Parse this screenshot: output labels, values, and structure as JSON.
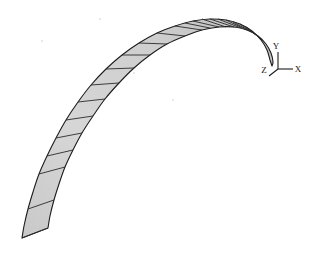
{
  "figure": {
    "background_color": "#ffffff",
    "surface_fill": "#d2d2d2",
    "surface_fill_light": "#dcdcdc",
    "surface_fill_dark": "#bdbdbd",
    "outline_color": "#1c1c1c",
    "rule_line_color": "#2b2b2b"
  },
  "axes": {
    "origin": {
      "x": 278,
      "y": 69
    },
    "labels": {
      "x": "X",
      "y": "Y",
      "z": "Z"
    },
    "label_positions": {
      "x": {
        "x": 298,
        "y": 72
      },
      "y": {
        "x": 276,
        "y": 49
      },
      "z": {
        "x": 264,
        "y": 73
      }
    },
    "axis_lines": {
      "x": {
        "x1": 278,
        "y1": 69,
        "x2": 293,
        "y2": 69
      },
      "y": {
        "x1": 278,
        "y1": 69,
        "x2": 278,
        "y2": 52
      },
      "z": {
        "x1": 278,
        "y1": 69,
        "x2": 269,
        "y2": 76
      }
    }
  },
  "surface": {
    "type": "developable-ruled-strip",
    "segment_count": 22,
    "description": "Tapering curved strip sweeping from lower-left pointed tip up over an apex and hooking down at the right",
    "outer_edge": [
      [
        22,
        238
      ],
      [
        24,
        226
      ],
      [
        28,
        209
      ],
      [
        33,
        192
      ],
      [
        39,
        174
      ],
      [
        47,
        156
      ],
      [
        56,
        138
      ],
      [
        66,
        120
      ],
      [
        78,
        102
      ],
      [
        91,
        85
      ],
      [
        106,
        69
      ],
      [
        122,
        55
      ],
      [
        139,
        43
      ],
      [
        157,
        33
      ],
      [
        175,
        26
      ],
      [
        193,
        21
      ],
      [
        210,
        19
      ],
      [
        226,
        20
      ],
      [
        240,
        24
      ],
      [
        252,
        31
      ],
      [
        261,
        40
      ],
      [
        267,
        50
      ],
      [
        270,
        60
      ]
    ],
    "inner_edge": [
      [
        48,
        228
      ],
      [
        50,
        216
      ],
      [
        54,
        200
      ],
      [
        59,
        184
      ],
      [
        65,
        167
      ],
      [
        73,
        150
      ],
      [
        82,
        133
      ],
      [
        93,
        116
      ],
      [
        105,
        99
      ],
      [
        119,
        83
      ],
      [
        134,
        68
      ],
      [
        150,
        55
      ],
      [
        167,
        44
      ],
      [
        185,
        36
      ],
      [
        202,
        30
      ],
      [
        219,
        27
      ],
      [
        234,
        27
      ],
      [
        247,
        30
      ],
      [
        258,
        36
      ],
      [
        266,
        44
      ],
      [
        271,
        53
      ],
      [
        273,
        62
      ],
      [
        272,
        66
      ]
    ],
    "rule_lines": [
      {
        "from": [
          22,
          238
        ],
        "to": [
          48,
          228
        ]
      },
      {
        "from": [
          28,
          209
        ],
        "to": [
          54,
          200
        ]
      },
      {
        "from": [
          39,
          174
        ],
        "to": [
          65,
          167
        ]
      },
      {
        "from": [
          47,
          156
        ],
        "to": [
          73,
          150
        ]
      },
      {
        "from": [
          56,
          138
        ],
        "to": [
          82,
          133
        ]
      },
      {
        "from": [
          66,
          120
        ],
        "to": [
          93,
          116
        ]
      },
      {
        "from": [
          78,
          102
        ],
        "to": [
          105,
          99
        ]
      },
      {
        "from": [
          91,
          85
        ],
        "to": [
          119,
          83
        ]
      },
      {
        "from": [
          106,
          69
        ],
        "to": [
          134,
          68
        ]
      },
      {
        "from": [
          122,
          55
        ],
        "to": [
          150,
          55
        ]
      },
      {
        "from": [
          139,
          43
        ],
        "to": [
          167,
          44
        ]
      },
      {
        "from": [
          157,
          33
        ],
        "to": [
          185,
          36
        ]
      },
      {
        "from": [
          175,
          26
        ],
        "to": [
          202,
          30
        ]
      },
      {
        "from": [
          185,
          23
        ],
        "to": [
          210,
          28
        ]
      },
      {
        "from": [
          193,
          21
        ],
        "to": [
          219,
          27
        ]
      },
      {
        "from": [
          202,
          19
        ],
        "to": [
          226,
          27
        ]
      },
      {
        "from": [
          210,
          19
        ],
        "to": [
          234,
          27
        ]
      },
      {
        "from": [
          218,
          19
        ],
        "to": [
          241,
          28
        ]
      },
      {
        "from": [
          226,
          20
        ],
        "to": [
          247,
          30
        ]
      },
      {
        "from": [
          233,
          22
        ],
        "to": [
          252,
          32
        ]
      },
      {
        "from": [
          240,
          24
        ],
        "to": [
          258,
          36
        ]
      },
      {
        "from": [
          246,
          27
        ],
        "to": [
          262,
          40
        ]
      }
    ]
  },
  "background_specks": [
    {
      "x": 41,
      "y": 40
    },
    {
      "x": 133,
      "y": 72
    },
    {
      "x": 172,
      "y": 99
    },
    {
      "x": 99,
      "y": 18
    }
  ]
}
